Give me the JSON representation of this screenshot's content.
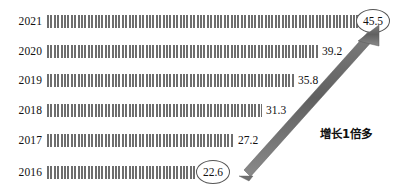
{
  "chart_data": {
    "type": "bar",
    "orientation": "horizontal",
    "title": "",
    "subtitle": "",
    "xlabel": "",
    "ylabel": "",
    "categories": [
      "2021",
      "2020",
      "2019",
      "2018",
      "2017",
      "2016"
    ],
    "values": [
      45.5,
      39.2,
      35.8,
      31.3,
      27.2,
      22.6
    ],
    "value_labels": [
      "45.5",
      "39.2",
      "35.8",
      "31.3",
      "27.2",
      "22.6"
    ],
    "highlighted": [
      "45.5",
      "22.6"
    ],
    "xlim": [
      0,
      45.5
    ],
    "grid": false,
    "legend": null,
    "series": [
      {
        "name": "",
        "values": [
          45.5,
          39.2,
          35.8,
          31.3,
          27.2,
          22.6
        ]
      }
    ],
    "annotations": [
      {
        "text": "增长1倍多",
        "kind": "growth-callout"
      }
    ],
    "bar_fill": "#6e6e6e",
    "arrow_color": "#6b6b6b",
    "circle_color": "#555555",
    "text_color": "#111111"
  },
  "rows": [
    {
      "year": "2021",
      "value": "45.5",
      "bar_end": 370,
      "top": 11,
      "circled": true,
      "label_x": 356
    },
    {
      "year": "2020",
      "value": "39.2",
      "bar_end": 318,
      "top": 41,
      "circled": false,
      "label_x": 322
    },
    {
      "year": "2019",
      "value": "35.8",
      "bar_end": 294,
      "top": 70,
      "circled": false,
      "label_x": 298
    },
    {
      "year": "2018",
      "value": "31.3",
      "bar_end": 262,
      "top": 100,
      "circled": false,
      "label_x": 266
    },
    {
      "year": "2017",
      "value": "27.2",
      "bar_end": 234,
      "top": 130,
      "circled": false,
      "label_x": 238
    },
    {
      "year": "2016",
      "value": "22.6",
      "bar_end": 197,
      "top": 162,
      "circled": true,
      "label_x": 196
    }
  ],
  "annotation": {
    "text": "增长1倍多",
    "x": 320,
    "y": 125
  },
  "layout": {
    "bar_start_x": 47
  }
}
